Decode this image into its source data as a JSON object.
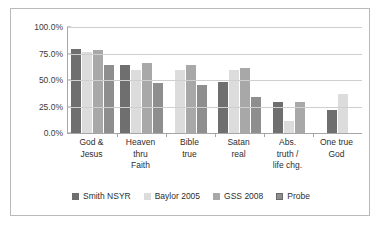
{
  "chart_data": {
    "type": "bar",
    "title": "",
    "subtitle": "",
    "xlabel": "",
    "ylabel": "",
    "ylim": [
      0,
      100
    ],
    "grid": true,
    "legend_position": "bottom",
    "y_ticks": [
      "0.0%",
      "25.0%",
      "50.0%",
      "75.0%",
      "100.0%"
    ],
    "y_tick_values": [
      0,
      25,
      50,
      75,
      100
    ],
    "categories": [
      "God & Jesus",
      "Heaven thru Faith",
      "Bible true",
      "Satan real",
      "Abs. truth / life chg.",
      "One true God"
    ],
    "category_lines": [
      [
        "God &",
        "Jesus"
      ],
      [
        "Heaven",
        "thru",
        "Faith"
      ],
      [
        "Bible",
        "true"
      ],
      [
        "Satan",
        "real"
      ],
      [
        "Abs.",
        "truth /",
        "life chg."
      ],
      [
        "One true",
        "God"
      ]
    ],
    "series": [
      {
        "name": "Smith NSYR",
        "color": "#6f6f6f",
        "values": [
          79,
          64.5,
          null,
          48.5,
          29,
          22
        ]
      },
      {
        "name": "Baylor 2005",
        "color": "#dcdcdc",
        "values": [
          76,
          59.5,
          59.5,
          59,
          11,
          37
        ]
      },
      {
        "name": "GSS 2008",
        "color": "#a8a8a8",
        "values": [
          78,
          66.5,
          64,
          61.5,
          29.5,
          null
        ]
      },
      {
        "name": "Probe",
        "color": "#8e8e8e",
        "values": [
          64,
          47.5,
          45,
          34,
          null,
          null
        ]
      }
    ]
  },
  "legend": {
    "items": [
      {
        "label": "Smith NSYR"
      },
      {
        "label": "Baylor 2005"
      },
      {
        "label": "GSS 2008"
      },
      {
        "label": "Probe"
      }
    ]
  }
}
